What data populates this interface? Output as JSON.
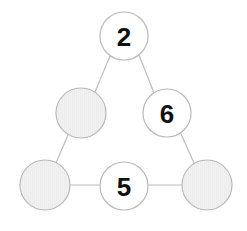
{
  "diagram": {
    "canvas": {
      "width": 247,
      "height": 231,
      "background": "#ffffff"
    },
    "style": {
      "stroke_color": "#b9b9b9",
      "stroke_width": 1.2,
      "edge_color": "#bdbdbd",
      "edge_width": 1.2,
      "filled_circle_color": "#f0f0f0",
      "empty_circle_color": "#ffffff",
      "label_color": "#111111",
      "label_font_size": 26
    },
    "nodes": [
      {
        "id": "node-top",
        "name": "circle-top-2",
        "label": "2",
        "filled": false,
        "cx": 124,
        "cy": 36,
        "r": 24
      },
      {
        "id": "node-upper-left",
        "name": "circle-upper-left-shaded",
        "label": "",
        "filled": true,
        "cx": 81,
        "cy": 113,
        "r": 25
      },
      {
        "id": "node-upper-right",
        "name": "circle-upper-right-6",
        "label": "6",
        "filled": false,
        "cx": 167,
        "cy": 113,
        "r": 24
      },
      {
        "id": "node-bottom-left",
        "name": "circle-bottom-left-shaded",
        "label": "",
        "filled": true,
        "cx": 45,
        "cy": 185,
        "r": 25
      },
      {
        "id": "node-bottom-center",
        "name": "circle-bottom-center-5",
        "label": "5",
        "filled": false,
        "cx": 124,
        "cy": 186,
        "r": 24
      },
      {
        "id": "node-bottom-right",
        "name": "circle-bottom-right-shaded",
        "label": "",
        "filled": true,
        "cx": 207,
        "cy": 185,
        "r": 25
      }
    ],
    "edges": [
      {
        "name": "edge-top-to-upper-left",
        "x1": 110,
        "y1": 56,
        "x2": 95,
        "y2": 92
      },
      {
        "name": "edge-top-to-upper-right",
        "x1": 139,
        "y1": 55,
        "x2": 154,
        "y2": 93
      },
      {
        "name": "edge-upper-left-to-bottom-left",
        "x1": 68,
        "y1": 135,
        "x2": 56,
        "y2": 163
      },
      {
        "name": "edge-upper-right-to-bottom-right",
        "x1": 181,
        "y1": 134,
        "x2": 194,
        "y2": 163
      },
      {
        "name": "edge-bottom-left-to-bottom-center",
        "x1": 70,
        "y1": 185,
        "x2": 100,
        "y2": 185
      },
      {
        "name": "edge-bottom-center-to-bottom-right",
        "x1": 148,
        "y1": 185,
        "x2": 182,
        "y2": 185
      }
    ]
  }
}
